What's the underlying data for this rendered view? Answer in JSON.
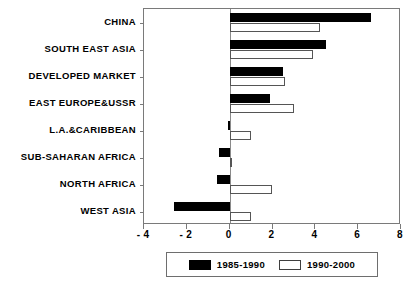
{
  "chart_data": {
    "type": "bar",
    "orientation": "horizontal",
    "title": "",
    "xlabel": "",
    "ylabel": "",
    "xlim": [
      -4,
      8
    ],
    "xticks": [
      -4,
      -2,
      0,
      2,
      4,
      6,
      8
    ],
    "xticklabels": [
      "- 4",
      "- 2",
      "0",
      "2",
      "4",
      "6",
      "8"
    ],
    "grid": false,
    "legend_position": "bottom-center",
    "categories": [
      "CHINA",
      "SOUTH EAST ASIA",
      "DEVELOPED MARKET",
      "EAST EUROPE&USSR",
      "L.A.&CARIBBEAN",
      "SUB-SAHARAN AFRICA",
      "NORTH AFRICA",
      "WEST ASIA"
    ],
    "series": [
      {
        "name": "1985-1990",
        "color": "#000000",
        "values": [
          6.6,
          4.5,
          2.5,
          1.9,
          -0.1,
          -0.5,
          -0.6,
          -2.6
        ]
      },
      {
        "name": "1990-2000",
        "color": "#ffffff",
        "values": [
          4.2,
          3.9,
          2.6,
          3.0,
          1.0,
          0.1,
          2.0,
          1.0
        ]
      }
    ]
  },
  "legend": {
    "entries": [
      {
        "label": "1985-1990"
      },
      {
        "label": "1990-2000"
      }
    ]
  }
}
